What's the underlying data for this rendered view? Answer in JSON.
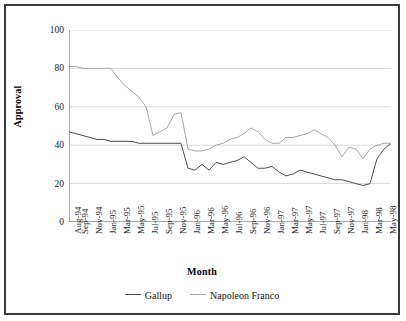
{
  "chart_data": {
    "type": "line",
    "title": "",
    "xlabel": "Month",
    "ylabel": "Approval",
    "ylim": [
      0,
      100
    ],
    "yticks": [
      0,
      20,
      40,
      60,
      80,
      100
    ],
    "grid": true,
    "legend_position": "bottom",
    "x": [
      "Aug-94",
      "Sep-94",
      "Oct-94",
      "Nov-94",
      "Dec-94",
      "Jan-95",
      "Feb-95",
      "Mar-95",
      "Apr-95",
      "May-95",
      "Jun-95",
      "Jul-95",
      "Aug-95",
      "Sep-95",
      "Oct-95",
      "Nov-95",
      "Dec-95",
      "Jan-96",
      "Feb-96",
      "Mar-96",
      "Apr-96",
      "May-96",
      "Jun-96",
      "Jul-96",
      "Aug-96",
      "Sep-96",
      "Oct-96",
      "Nov-96",
      "Dec-96",
      "Jan-97",
      "Feb-97",
      "Mar-97",
      "Apr-97",
      "May-97",
      "Jun-97",
      "Jul-97",
      "Aug-97",
      "Sep-97",
      "Oct-97",
      "Nov-97",
      "Dec-97",
      "Jan-98",
      "Feb-98",
      "Mar-98",
      "Apr-98",
      "May-98",
      "Jun-98"
    ],
    "xtick_labels": [
      "Aug-94",
      "Sep-94",
      "Nov-94",
      "Jan-95",
      "Mar-95",
      "May-95",
      "Jul-95",
      "Sep-95",
      "Nov-95",
      "Jan-96",
      "Mar-96",
      "May-96",
      "Jul-96",
      "Sep-96",
      "Nov-96",
      "Jan-97",
      "Mar-97",
      "May-97",
      "Jul-97",
      "Sep-97",
      "Nov-97",
      "Jan-98",
      "Mar-98",
      "May-98"
    ],
    "xtick_indices": [
      0,
      1,
      3,
      5,
      7,
      9,
      11,
      13,
      15,
      17,
      19,
      21,
      23,
      25,
      27,
      29,
      31,
      33,
      35,
      37,
      39,
      41,
      43,
      45
    ],
    "series": [
      {
        "name": "Gallup",
        "color": "#4d4d4d",
        "values": [
          47,
          46,
          45,
          44,
          43,
          43,
          42,
          42,
          42,
          42,
          41,
          41,
          41,
          41,
          41,
          41,
          41,
          28,
          27,
          30,
          27,
          31,
          30,
          31,
          32,
          34,
          31,
          28,
          28,
          29,
          26,
          24,
          25,
          27,
          26,
          25,
          24,
          23,
          22,
          22,
          21,
          20,
          19,
          20,
          33,
          38,
          41
        ]
      },
      {
        "name": "Napoleon Franco",
        "color": "#a6a6a6",
        "values": [
          81,
          81,
          80,
          80,
          80,
          80,
          80,
          75,
          71,
          68,
          65,
          60,
          45,
          47,
          49,
          56,
          57,
          38,
          37,
          37,
          38,
          40,
          41,
          43,
          44,
          46,
          49,
          47,
          43,
          41,
          41,
          44,
          44,
          45,
          46,
          48,
          46,
          44,
          40,
          34,
          39,
          38,
          33,
          38,
          40,
          41,
          41
        ]
      }
    ]
  }
}
